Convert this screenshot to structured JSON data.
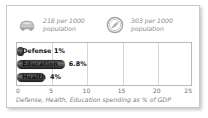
{
  "card": {
    "background": "#ffffff",
    "border_color": "#c9c9c9"
  },
  "stats": [
    {
      "icon": "car-icon",
      "value": "218 per 1000",
      "unit": "population",
      "text": "218 per 1000\npopulation"
    },
    {
      "icon": "telephone-circle-icon",
      "value": "303 per 1000",
      "unit": "population",
      "text": "303 per 1000\npopulation"
    }
  ],
  "chart_data": {
    "type": "bar",
    "orientation": "horizontal",
    "title": "",
    "categories": [
      "Defense",
      "Education",
      "Health"
    ],
    "values": [
      1,
      6.8,
      4
    ],
    "value_labels": [
      "1%",
      "6.8%",
      "4%"
    ],
    "xlabel": "Defense, Health, Education spending as % of GDP",
    "ylabel": "",
    "xlim": [
      0,
      25
    ],
    "xticks": [
      0,
      5,
      10,
      15,
      20,
      25
    ],
    "xtick_labels": [
      "0",
      "5",
      "10",
      "15",
      "20",
      "25"
    ],
    "grid": true,
    "legend": false,
    "bar_color": "#3a3a3a"
  },
  "caption": "Defense, Health, Education spending as % of GDP"
}
